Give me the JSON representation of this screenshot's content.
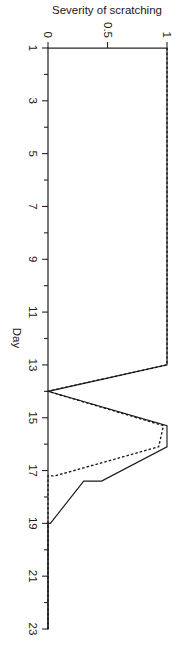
{
  "figure": {
    "name": "severity-of-scratching-line-chart",
    "orientation": "rotated-90-clockwise",
    "background_color": "#ffffff",
    "ink_color": "#1a1a1a"
  },
  "chart_data": {
    "type": "line",
    "title": "",
    "subtitle": "",
    "xlabel": "Day",
    "ylabel": "Severity of scratching",
    "xlim": [
      1,
      23
    ],
    "ylim": [
      0,
      1
    ],
    "grid": false,
    "legend": "none",
    "xticks": [
      1,
      3,
      5,
      7,
      9,
      11,
      13,
      15,
      17,
      19,
      21,
      23
    ],
    "xtick_labels": [
      "1",
      "3",
      "5",
      "7",
      "9",
      "11",
      "13",
      "15",
      "17",
      "19",
      "21",
      "23"
    ],
    "xminor_ticks": [
      2,
      4,
      6,
      8,
      10,
      12,
      14,
      16,
      18,
      20,
      22
    ],
    "yticks": [
      0,
      0.5,
      1
    ],
    "ytick_labels": [
      "0",
      "0.5",
      "1"
    ],
    "series": [
      {
        "name": "solid",
        "style": "solid",
        "color": "#1a1a1a",
        "x": [
          1,
          13,
          14,
          15.3,
          16.1,
          17.4,
          17.4,
          19,
          19,
          23
        ],
        "values": [
          1,
          1,
          0,
          1,
          1,
          0.45,
          0.3,
          0.02,
          0,
          0
        ]
      },
      {
        "name": "dashed",
        "style": "dashed",
        "color": "#1a1a1a",
        "x": [
          1,
          13,
          14,
          15.3,
          16.1,
          17.2,
          17.2,
          23
        ],
        "values": [
          1,
          1,
          0,
          0.97,
          0.93,
          0.06,
          0,
          0
        ]
      }
    ]
  },
  "axes": {
    "x_axis_label": "Day",
    "y_axis_label": "Severity of scratching",
    "x_tick_labels": [
      "1",
      "3",
      "5",
      "7",
      "9",
      "11",
      "13",
      "15",
      "17",
      "19",
      "21",
      "23"
    ],
    "y_tick_labels": [
      "0",
      "0.5",
      "1"
    ]
  }
}
